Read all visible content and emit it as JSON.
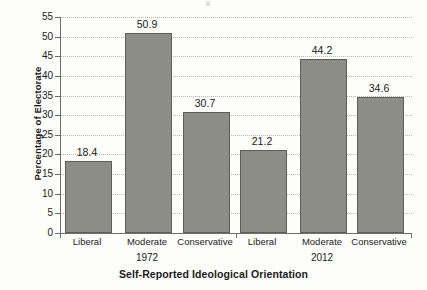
{
  "chart_data": {
    "type": "bar",
    "title": "",
    "xlabel": "Self-Reported Ideological Orientation",
    "ylabel": "Percentage of Electorate",
    "ylim": [
      0,
      55
    ],
    "ytick_step": 5,
    "yticks": [
      0,
      5,
      10,
      15,
      20,
      25,
      30,
      35,
      40,
      45,
      50,
      55
    ],
    "grid": true,
    "legend": "none",
    "groups": [
      "1972",
      "2012"
    ],
    "categories": [
      "Liberal",
      "Moderate",
      "Conservative"
    ],
    "series": [
      {
        "name": "1972",
        "values": [
          18.4,
          50.9,
          30.7
        ]
      },
      {
        "name": "2012",
        "values": [
          21.2,
          44.2,
          34.6
        ]
      }
    ],
    "bars": [
      {
        "group": "1972",
        "category": "Liberal",
        "value": 18.4,
        "label": "18.4"
      },
      {
        "group": "1972",
        "category": "Moderate",
        "value": 50.9,
        "label": "50.9"
      },
      {
        "group": "1972",
        "category": "Conservative",
        "value": 30.7,
        "label": "30.7"
      },
      {
        "group": "2012",
        "category": "Liberal",
        "value": 21.2,
        "label": "21.2"
      },
      {
        "group": "2012",
        "category": "Moderate",
        "value": 44.2,
        "label": "44.2"
      },
      {
        "group": "2012",
        "category": "Conservative",
        "value": 34.6,
        "label": "34.6"
      }
    ],
    "colors": {
      "bar_fill": "#8d8d87",
      "bar_border": "#5e5e58",
      "axis": "#6f6f68",
      "gridline": "#b9b9ae",
      "text": "#1b1b1b",
      "background": "#fdfdfa"
    }
  },
  "axes": {
    "y_title": "Percentage of Electorate",
    "x_title": "Self-Reported Ideological Orientation",
    "y_tick_labels": [
      "0",
      "5",
      "10",
      "15",
      "20",
      "25",
      "30",
      "35",
      "40",
      "45",
      "50",
      "55"
    ]
  },
  "category_labels": [
    "Liberal",
    "Moderate",
    "Conservative",
    "Liberal",
    "Moderate",
    "Conservative"
  ],
  "group_labels": [
    "1972",
    "2012"
  ]
}
